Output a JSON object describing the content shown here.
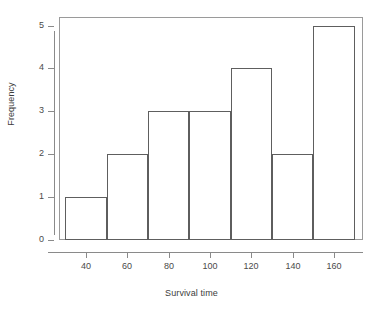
{
  "chart_data": {
    "type": "bar",
    "chart_subtype": "histogram",
    "title": "",
    "xlabel": "Survival time",
    "ylabel": "Frequency",
    "bin_width": 20,
    "bin_edges": [
      30,
      50,
      70,
      90,
      110,
      130,
      150,
      170
    ],
    "categories": [
      "30-50",
      "50-70",
      "70-90",
      "90-110",
      "110-130",
      "130-150",
      "150-170"
    ],
    "midpoints": [
      40,
      60,
      80,
      100,
      120,
      140,
      160
    ],
    "values": [
      1,
      2,
      3,
      3,
      4,
      2,
      5
    ],
    "xlim": [
      27,
      174
    ],
    "ylim": [
      0,
      5.2
    ],
    "x_ticks": [
      40,
      60,
      80,
      100,
      120,
      140,
      160
    ],
    "x_tick_labels": [
      "40",
      "60",
      "80",
      "100",
      "120",
      "140",
      "160"
    ],
    "y_ticks": [
      0,
      1,
      2,
      3,
      4,
      5
    ],
    "y_tick_labels": [
      "0",
      "1",
      "2",
      "3",
      "4",
      "5"
    ],
    "grid": false,
    "legend": false,
    "legend_position": "none",
    "colors": {
      "bar_outline": "#5e5e5e",
      "bar_fill": "#ffffff",
      "axis": "#8a8a8a",
      "frame": "#9a9a9a",
      "text": "#3c3c3c",
      "background": "#ffffff"
    }
  }
}
